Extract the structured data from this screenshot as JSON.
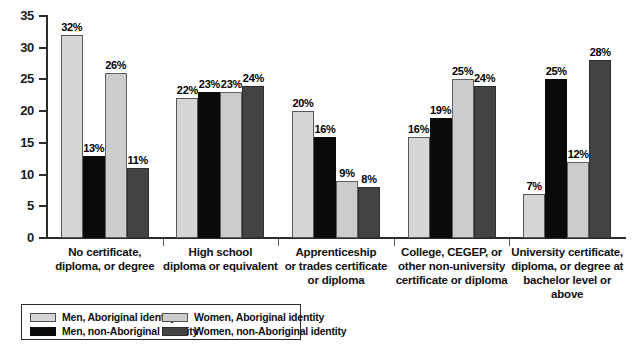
{
  "chart_data": {
    "type": "bar",
    "title": "",
    "subtitle": "",
    "xlabel": "",
    "ylabel": "",
    "ylim": [
      0,
      35
    ],
    "ytick_step": 5,
    "yticks": [
      "35",
      "30",
      "25",
      "20",
      "15",
      "10",
      "5",
      "0"
    ],
    "grid": false,
    "legend_position": "bottom-left",
    "value_suffix": "%",
    "categories": [
      "No certificate,\ndiploma, or degree",
      "High school\ndiploma or equivalent",
      "Apprenticeship\nor trades certificate\nor diploma",
      "College, CEGEP, or\nother non-university\ncertificate or diploma",
      "University certificate,\ndiploma, or degree at\nbachelor level or above"
    ],
    "category_lines": [
      [
        "No certificate,",
        "diploma, or degree"
      ],
      [
        "High school",
        "diploma or equivalent"
      ],
      [
        "Apprenticeship",
        "or trades certificate",
        "or diploma"
      ],
      [
        "College, CEGEP, or",
        "other non-university",
        "certificate or diploma"
      ],
      [
        "University certificate,",
        "diploma, or degree at",
        "bachelor level or above"
      ]
    ],
    "series": [
      {
        "name": "Men, Aboriginal identity",
        "color": "#d6d6d6",
        "values": [
          32,
          22,
          20,
          16,
          7
        ],
        "labels": [
          "32%",
          "22%",
          "20%",
          "16%",
          "7%"
        ]
      },
      {
        "name": "Men, non-Aboriginal identity",
        "color": "#0a0a0a",
        "values": [
          13,
          23,
          16,
          19,
          25
        ],
        "labels": [
          "13%",
          "23%",
          "16%",
          "19%",
          "25%"
        ]
      },
      {
        "name": "Women, Aboriginal identity",
        "color": "#cccccc",
        "values": [
          26,
          23,
          9,
          25,
          12
        ],
        "labels": [
          "26%",
          "23%",
          "9%",
          "25%",
          "12%"
        ]
      },
      {
        "name": "Women, non-Aboriginal identity",
        "color": "#434343",
        "values": [
          11,
          24,
          8,
          24,
          28
        ],
        "labels": [
          "11%",
          "24%",
          "8%",
          "24%",
          "28%"
        ]
      }
    ]
  },
  "legend": {
    "entries": [
      {
        "label": "Men, Aboriginal identity",
        "swatch": "s0"
      },
      {
        "label": "Women, Aboriginal identity",
        "swatch": "s2"
      },
      {
        "label": "Men, non-Aboriginal identity",
        "swatch": "s1"
      },
      {
        "label": "Women, non-Aboriginal identity",
        "swatch": "s3"
      }
    ]
  }
}
